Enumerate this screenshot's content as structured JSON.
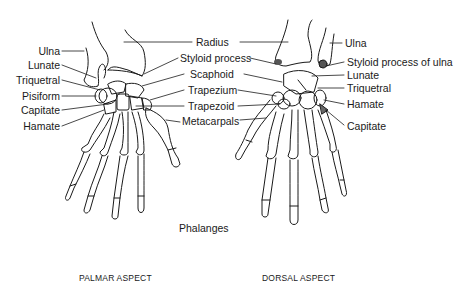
{
  "diagram": {
    "palmar": {
      "caption": "PALMAR ASPECT",
      "left_labels": [
        "Ulna",
        "Lunate",
        "Triquetral",
        "Pisiform",
        "Capitate",
        "Hamate"
      ],
      "center_labels": [
        "Radius",
        "Styloid process",
        "Scaphoid",
        "Trapezium",
        "Trapezoid",
        "Metacarpals"
      ]
    },
    "dorsal": {
      "caption": "DORSAL ASPECT",
      "right_labels": [
        "Ulna",
        "Styloid process of ulna",
        "Lunate",
        "Triquetral",
        "Hamate",
        "Capitate"
      ]
    },
    "phalanges_label": "Phalanges",
    "colors": {
      "ink": "#1a1a1a",
      "background": "#ffffff"
    }
  }
}
